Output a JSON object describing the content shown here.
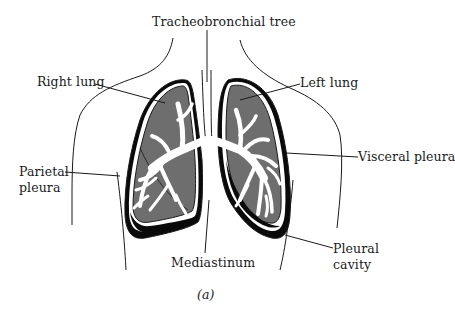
{
  "figure": {
    "title": "Tracheobronchial tree",
    "caption": "(a)",
    "colors": {
      "lung_fill": "#6e6e6e",
      "pleural_cavity": "#0a0a0a",
      "airway": "#ffffff",
      "outline": "#1a1a1a",
      "background": "#ffffff"
    }
  },
  "labels": {
    "trachea": "Tracheobronchial tree",
    "right_lung": "Right lung",
    "left_lung": "Left lung",
    "visceral_pleura": "Visceral pleura",
    "parietal_pleura_line1": "Parietal",
    "parietal_pleura_line2": "pleura",
    "mediastinum": "Mediastinum",
    "pleural_cavity_line1": "Pleural",
    "pleural_cavity_line2": "cavity",
    "caption": "(a)"
  }
}
